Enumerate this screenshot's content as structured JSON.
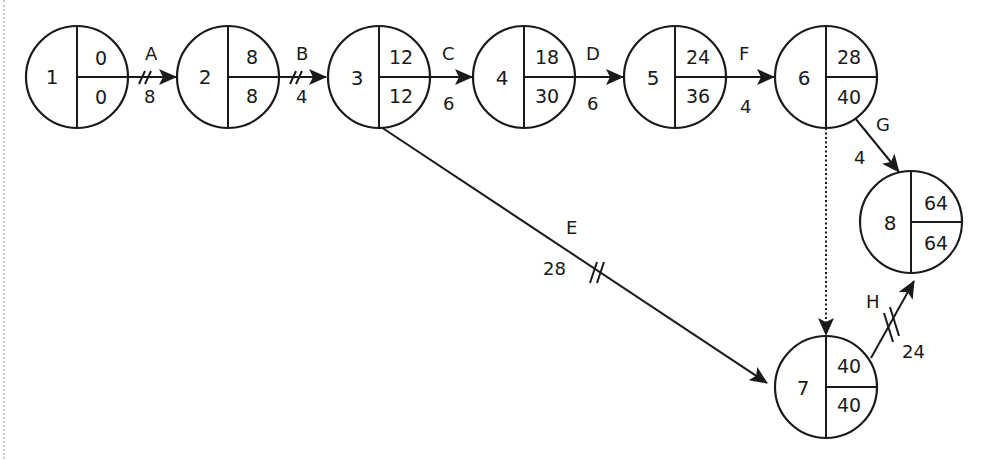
{
  "diagram": {
    "type": "activity-on-arrow network (critical path)",
    "nodes": [
      {
        "id": "1",
        "earliest": "0",
        "latest": "0",
        "cx": 77,
        "cy": 77
      },
      {
        "id": "2",
        "earliest": "8",
        "latest": "8",
        "cx": 228,
        "cy": 77
      },
      {
        "id": "3",
        "earliest": "12",
        "latest": "12",
        "cx": 379,
        "cy": 77
      },
      {
        "id": "4",
        "earliest": "18",
        "latest": "30",
        "cx": 524,
        "cy": 77
      },
      {
        "id": "5",
        "earliest": "24",
        "latest": "36",
        "cx": 675,
        "cy": 77
      },
      {
        "id": "6",
        "earliest": "28",
        "latest": "40",
        "cx": 826,
        "cy": 77
      },
      {
        "id": "7",
        "earliest": "40",
        "latest": "40",
        "cx": 826,
        "cy": 387
      },
      {
        "id": "8",
        "earliest": "64",
        "latest": "64",
        "cx": 911,
        "cy": 222
      }
    ],
    "activities": [
      {
        "name": "A",
        "duration": "8",
        "from": "1",
        "to": "2",
        "critical": true,
        "dummy": false
      },
      {
        "name": "B",
        "duration": "4",
        "from": "2",
        "to": "3",
        "critical": true,
        "dummy": false
      },
      {
        "name": "C",
        "duration": "6",
        "from": "3",
        "to": "4",
        "critical": false,
        "dummy": false
      },
      {
        "name": "D",
        "duration": "6",
        "from": "4",
        "to": "5",
        "critical": false,
        "dummy": false
      },
      {
        "name": "F",
        "duration": "4",
        "from": "5",
        "to": "6",
        "critical": false,
        "dummy": false
      },
      {
        "name": "G",
        "duration": "4",
        "from": "6",
        "to": "8",
        "critical": false,
        "dummy": false
      },
      {
        "name": "E",
        "duration": "28",
        "from": "3",
        "to": "7",
        "critical": true,
        "dummy": false
      },
      {
        "name": "H",
        "duration": "24",
        "from": "7",
        "to": "8",
        "critical": true,
        "dummy": false
      },
      {
        "name": "",
        "duration": "",
        "from": "6",
        "to": "7",
        "critical": false,
        "dummy": true
      }
    ]
  }
}
